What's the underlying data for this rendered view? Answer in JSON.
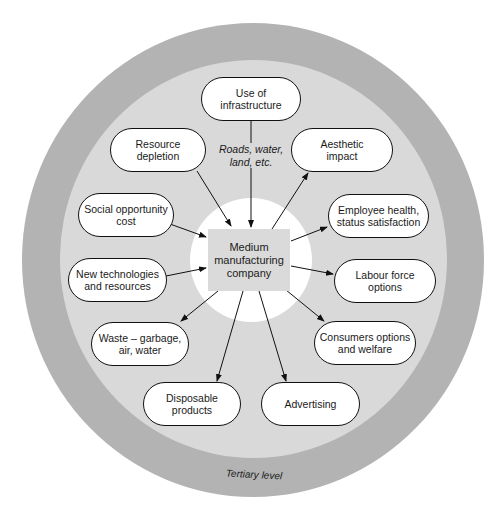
{
  "diagram": {
    "center": {
      "label": "Medium\nmanufacturing\ncompany"
    },
    "outer_ring_label": "Tertiary level",
    "infrastructure_note": "Roads, water,\nland, etc.",
    "nodes": [
      {
        "id": "use-of-infrastructure",
        "label": "Use of\ninfrastructure",
        "direction": "into-company"
      },
      {
        "id": "resource-depletion",
        "label": "Resource\ndepletion",
        "direction": "into-company"
      },
      {
        "id": "aesthetic-impact",
        "label": "Aesthetic\nimpact",
        "direction": "from-company"
      },
      {
        "id": "social-opportunity-cost",
        "label": "Social opportunity\ncost",
        "direction": "into-company"
      },
      {
        "id": "employee-health",
        "label": "Employee health,\nstatus satisfaction",
        "direction": "from-company"
      },
      {
        "id": "new-technologies",
        "label": "New technologies\nand resources",
        "direction": "into-company"
      },
      {
        "id": "labour-force-options",
        "label": "Labour force\noptions",
        "direction": "from-company"
      },
      {
        "id": "waste",
        "label": "Waste – garbage,\nair, water",
        "direction": "from-company"
      },
      {
        "id": "consumers-options",
        "label": "Consumers options\nand welfare",
        "direction": "from-company"
      },
      {
        "id": "disposable-products",
        "label": "Disposable\nproducts",
        "direction": "from-company"
      },
      {
        "id": "advertising",
        "label": "Advertising",
        "direction": "from-company"
      }
    ],
    "colors": {
      "outer_ring": "#b3b3b3",
      "inner_ring": "#d9d9d9",
      "core": "#ffffff",
      "center_box": "#dadada",
      "node_fill": "#ffffff",
      "stroke": "#111111"
    }
  }
}
